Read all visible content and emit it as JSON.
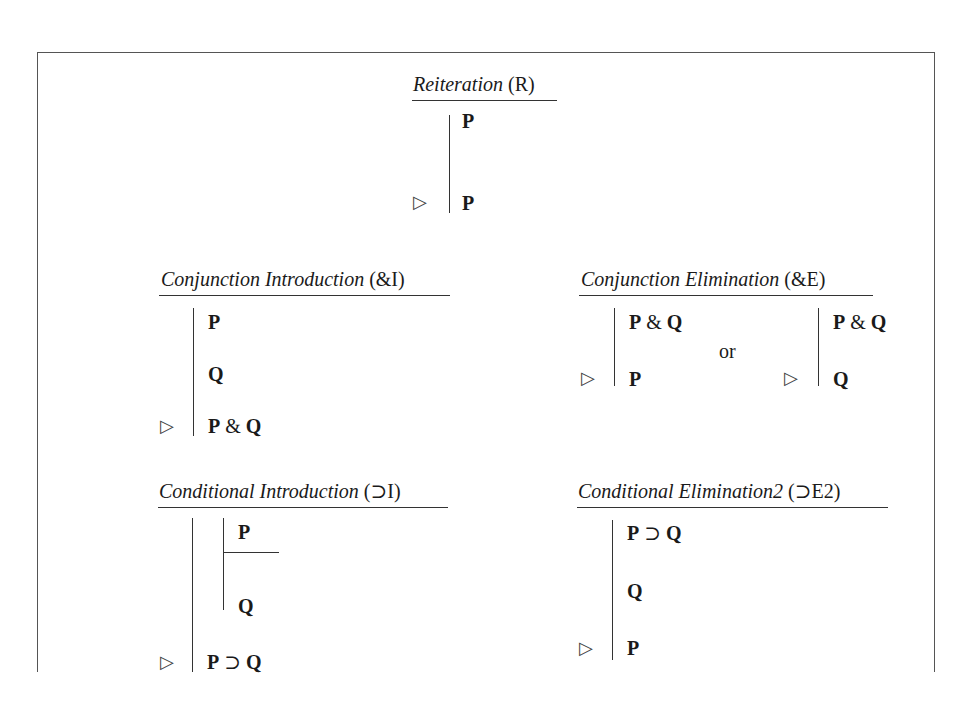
{
  "rules": {
    "reiteration": {
      "name": "Reiteration",
      "abbr": "(R)",
      "premises": [
        "P"
      ],
      "conclusion": "P"
    },
    "conj_intro": {
      "name": "Conjunction Introduction",
      "abbr": "(&I)",
      "premises": [
        "P",
        "Q"
      ],
      "conclusion": {
        "left": "P",
        "op": "&",
        "right": "Q"
      }
    },
    "conj_elim": {
      "name": "Conjunction Elimination",
      "abbr": "(&E)",
      "left": {
        "premise": {
          "left": "P",
          "op": "&",
          "right": "Q"
        },
        "conclusion": "P"
      },
      "separator": "or",
      "right": {
        "premise": {
          "left": "P",
          "op": "&",
          "right": "Q"
        },
        "conclusion": "Q"
      }
    },
    "cond_intro": {
      "name": "Conditional Introduction",
      "abbr": "(⊃I)",
      "subproof": {
        "assumption": "P",
        "result": "Q"
      },
      "conclusion": {
        "left": "P",
        "op": "⊃",
        "right": "Q"
      }
    },
    "cond_elim2": {
      "name": "Conditional Elimination2",
      "abbr": "(⊃E2)",
      "premises": [
        {
          "left": "P",
          "op": "⊃",
          "right": "Q"
        },
        "Q"
      ],
      "conclusion": "P"
    }
  },
  "symbols": {
    "therefore": "▷"
  }
}
